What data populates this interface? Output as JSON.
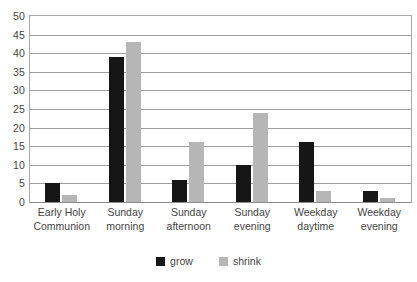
{
  "chart_data": {
    "type": "bar",
    "title": "",
    "xlabel": "",
    "ylabel": "",
    "ylim": [
      0,
      50
    ],
    "ytick_step": 5,
    "yticks": [
      50,
      45,
      40,
      35,
      30,
      25,
      20,
      15,
      10,
      5,
      0
    ],
    "grid": true,
    "legend_position": "bottom-center",
    "categories": [
      "Early Holy Communion",
      "Sunday morning",
      "Sunday afternoon",
      "Sunday evening",
      "Weekday daytime",
      "Weekday evening"
    ],
    "category_lines": [
      [
        "Early Holy",
        "Communion"
      ],
      [
        "Sunday",
        "morning"
      ],
      [
        "Sunday",
        "afternoon"
      ],
      [
        "Sunday",
        "evening"
      ],
      [
        "Weekday",
        "daytime"
      ],
      [
        "Weekday",
        "evening"
      ]
    ],
    "series": [
      {
        "name": "grow",
        "color": "#161616",
        "values": [
          5,
          39,
          6,
          10,
          16,
          3
        ]
      },
      {
        "name": "shrink",
        "color": "#b6b6b6",
        "values": [
          2,
          43,
          16,
          24,
          3,
          1
        ]
      }
    ]
  },
  "colors": {
    "grow": "#161616",
    "shrink": "#b6b6b6",
    "gridline": "#9e9e9e",
    "frame": "#a9a9a9",
    "text": "#444444",
    "background": "#ffffff"
  },
  "clipped_top_text": ""
}
